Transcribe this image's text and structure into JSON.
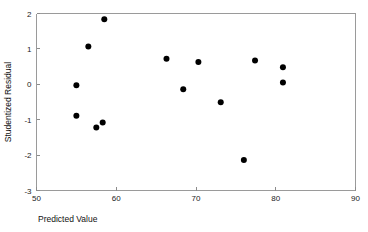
{
  "chart_data": {
    "type": "scatter",
    "title": "",
    "xlabel": "Predicted Value",
    "ylabel": "Studentized Residual",
    "xlim": [
      50,
      90
    ],
    "ylim": [
      -3,
      2
    ],
    "xticks": [
      50,
      60,
      70,
      80,
      90
    ],
    "yticks": [
      2,
      1,
      0,
      -1,
      -2,
      -3
    ],
    "xtick_labels": [
      "50",
      "60",
      "70",
      "80",
      "90"
    ],
    "ytick_labels": [
      "2",
      "1",
      "0",
      "-1",
      "-2",
      "-3"
    ],
    "grid": false,
    "legend": null,
    "marker": "filled-circle",
    "marker_color": "#000000",
    "marker_size": 3,
    "frame_color": "#9a9a9a",
    "background": "#ffffff",
    "n_points": 13,
    "points": [
      {
        "x": 58.5,
        "y": 1.84
      },
      {
        "x": 56.5,
        "y": 1.07
      },
      {
        "x": 55.0,
        "y": -0.03
      },
      {
        "x": 55.0,
        "y": -0.89
      },
      {
        "x": 57.5,
        "y": -1.22
      },
      {
        "x": 58.3,
        "y": -1.08
      },
      {
        "x": 66.3,
        "y": 0.72
      },
      {
        "x": 70.3,
        "y": 0.63
      },
      {
        "x": 68.4,
        "y": -0.14
      },
      {
        "x": 73.1,
        "y": -0.51
      },
      {
        "x": 76.0,
        "y": -2.14
      },
      {
        "x": 77.4,
        "y": 0.67
      },
      {
        "x": 80.9,
        "y": 0.48
      },
      {
        "x": 80.9,
        "y": 0.05
      }
    ]
  }
}
